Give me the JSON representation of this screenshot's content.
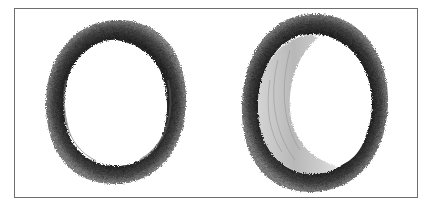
{
  "figure": {
    "panels": [
      {
        "id": "normal-artery",
        "description": "Cross-section of a normal artery: thick dark muscular wall, open round lumen",
        "wall_color": "#3a3a3a",
        "lumen_color": "#ffffff"
      },
      {
        "id": "atherosclerotic-artery",
        "description": "Cross-section of an artery with crescent-shaped atherosclerotic plaque narrowing the lumen",
        "wall_color": "#333333",
        "plaque_color": "#c4c4c4",
        "lumen_color": "#ffffff"
      }
    ],
    "frame_color": "#6e6e6e",
    "background_color": "#ffffff"
  }
}
